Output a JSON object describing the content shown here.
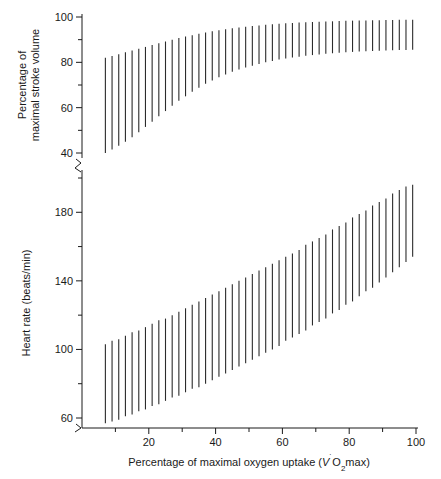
{
  "chart_data": {
    "type": "line",
    "title": "",
    "xlabel": "Percentage of maximal oxygen uptake (V̇O₂max)",
    "xlabel_parts": {
      "pre": "Percentage of maximal oxygen uptake (",
      "v": "V",
      "dot": "˙",
      "o": "O",
      "sub": "2",
      "post": "max)"
    },
    "xlim": [
      0,
      100
    ],
    "x_major_ticks": [
      20,
      40,
      60,
      80,
      100
    ],
    "x_minor_ticks": [
      10,
      30,
      50,
      70,
      90
    ],
    "x_tick_labels": [
      "20",
      "40",
      "60",
      "80",
      "100"
    ],
    "grid": false,
    "legend": "none",
    "panels": [
      {
        "id": "stroke-volume",
        "ylabel_line1": "Percentage of",
        "ylabel_line2": "maximal stroke volume",
        "ylabel": "Percentage of maximal stroke volume",
        "ylim": [
          38,
          100
        ],
        "y_major_ticks": [
          40,
          60,
          80,
          100
        ],
        "y_minor_ticks": [
          50,
          70,
          90
        ],
        "y_tick_labels": [
          "40",
          "60",
          "80",
          "100"
        ],
        "axis_break": true,
        "series_name": "Stroke volume range",
        "marker": "vertical-range-bar",
        "x": [
          7,
          9,
          11,
          13,
          15,
          17,
          19,
          21,
          23,
          25,
          27,
          29,
          31,
          33,
          35,
          37,
          39,
          41,
          43,
          45,
          47,
          49,
          51,
          53,
          55,
          57,
          59,
          61,
          63,
          65,
          67,
          69,
          71,
          73,
          75,
          77,
          79,
          81,
          83,
          85,
          87,
          89,
          91,
          93,
          95,
          97,
          99
        ],
        "y_low": [
          40.0,
          41.5,
          43.2,
          45.0,
          47.0,
          49.2,
          51.5,
          53.8,
          56.2,
          58.5,
          60.8,
          63.0,
          65.0,
          67.0,
          68.8,
          70.5,
          72.0,
          73.4,
          74.6,
          75.8,
          76.8,
          77.7,
          78.5,
          79.3,
          80.0,
          80.6,
          81.2,
          81.7,
          82.1,
          82.5,
          82.9,
          83.2,
          83.5,
          83.8,
          84.0,
          84.2,
          84.4,
          84.6,
          84.8,
          84.9,
          85.0,
          85.1,
          85.2,
          85.3,
          85.4,
          85.4,
          85.5
        ],
        "y_high": [
          82.0,
          82.8,
          83.6,
          84.4,
          85.2,
          86.0,
          86.8,
          87.6,
          88.4,
          89.2,
          90.0,
          90.7,
          91.4,
          92.0,
          92.6,
          93.2,
          93.7,
          94.2,
          94.6,
          95.0,
          95.4,
          95.7,
          96.0,
          96.3,
          96.6,
          96.8,
          97.0,
          97.2,
          97.4,
          97.6,
          97.7,
          97.8,
          97.9,
          98.0,
          98.1,
          98.2,
          98.3,
          98.4,
          98.5,
          98.5,
          98.6,
          98.6,
          98.7,
          98.7,
          98.8,
          98.8,
          98.8
        ]
      },
      {
        "id": "heart-rate",
        "ylabel": "Heart rate (beats/min)",
        "ylim": [
          55,
          200
        ],
        "y_major_ticks": [
          60,
          100,
          140,
          180
        ],
        "y_minor_ticks": [
          80,
          120,
          160,
          200
        ],
        "y_tick_labels": [
          "60",
          "100",
          "140",
          "180"
        ],
        "axis_break": true,
        "series_name": "Heart rate range",
        "marker": "vertical-range-bar",
        "x": [
          7,
          9,
          11,
          13,
          15,
          17,
          19,
          21,
          23,
          25,
          27,
          29,
          31,
          33,
          35,
          37,
          39,
          41,
          43,
          45,
          47,
          49,
          51,
          53,
          55,
          57,
          59,
          61,
          63,
          65,
          67,
          69,
          71,
          73,
          75,
          77,
          79,
          81,
          83,
          85,
          87,
          89,
          91,
          93,
          95,
          97,
          99
        ],
        "y_low": [
          57,
          58,
          59,
          61,
          62,
          64,
          65,
          67,
          68,
          70,
          72,
          73,
          75,
          77,
          78,
          80,
          82,
          84,
          86,
          88,
          90,
          92,
          94,
          96,
          98,
          100,
          102,
          105,
          107,
          109,
          111,
          114,
          116,
          118,
          121,
          123,
          126,
          128,
          131,
          134,
          136,
          139,
          142,
          145,
          148,
          151,
          154
        ],
        "y_high": [
          103,
          105,
          106,
          108,
          110,
          111,
          113,
          115,
          117,
          118,
          120,
          122,
          124,
          126,
          128,
          130,
          132,
          134,
          136,
          138,
          140,
          142,
          144,
          146,
          148,
          150,
          152,
          154,
          156,
          158,
          161,
          163,
          165,
          167,
          170,
          172,
          174,
          177,
          179,
          181,
          184,
          186,
          188,
          191,
          193,
          195,
          196
        ]
      }
    ]
  }
}
